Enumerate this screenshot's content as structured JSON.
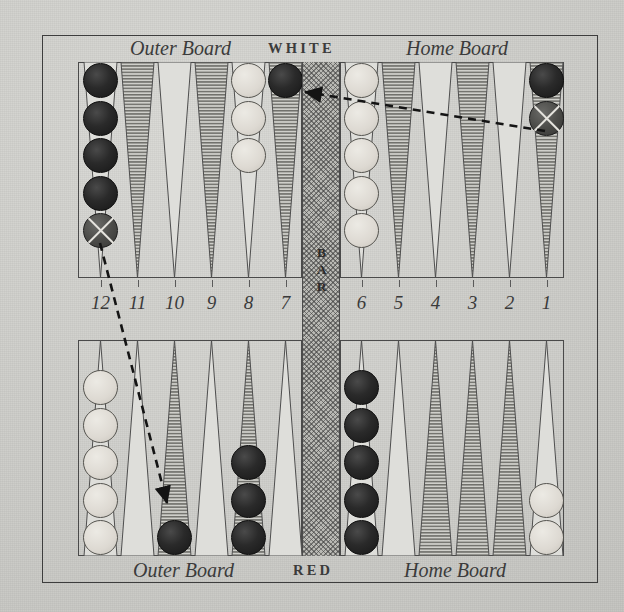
{
  "figure": {
    "kind": "backgammon-board-diagram",
    "bar_label_letters": [
      "B",
      "A",
      "R"
    ]
  },
  "captions": {
    "top_outer": "Outer Board",
    "top_player": "WHITE",
    "top_home": "Home Board",
    "bottom_outer": "Outer Board",
    "bottom_player": "RED",
    "bottom_home": "Home Board"
  },
  "point_numbers": [
    "12",
    "11",
    "10",
    "9",
    "8",
    "7",
    "6",
    "5",
    "4",
    "3",
    "2",
    "1"
  ],
  "colors": {
    "paper": "#cfcfcb",
    "ink": "#3d3d3d",
    "dark_checker": "#1c1c1c",
    "light_checker": "#ddd9d2",
    "bar_fill": "#b9b9b4",
    "hatched_point": "#9a9a95",
    "plain_point": "#d8d8d3"
  },
  "points": {
    "top": [
      {
        "number": "12",
        "shade": "plain",
        "checkers": [
          "dark",
          "dark",
          "dark",
          "dark",
          "marked"
        ]
      },
      {
        "number": "11",
        "shade": "hatched",
        "checkers": []
      },
      {
        "number": "10",
        "shade": "plain",
        "checkers": []
      },
      {
        "number": "9",
        "shade": "hatched",
        "checkers": []
      },
      {
        "number": "8",
        "shade": "plain",
        "checkers": [
          "light",
          "light",
          "light"
        ]
      },
      {
        "number": "7",
        "shade": "hatched",
        "checkers": [
          "dark"
        ]
      },
      {
        "number": "6",
        "shade": "plain",
        "checkers": [
          "light",
          "light",
          "light",
          "light",
          "light"
        ]
      },
      {
        "number": "5",
        "shade": "hatched",
        "checkers": []
      },
      {
        "number": "4",
        "shade": "plain",
        "checkers": []
      },
      {
        "number": "3",
        "shade": "hatched",
        "checkers": []
      },
      {
        "number": "2",
        "shade": "plain",
        "checkers": []
      },
      {
        "number": "1",
        "shade": "hatched",
        "checkers": [
          "dark",
          "marked"
        ]
      }
    ],
    "bottom": [
      {
        "number": "12",
        "shade": "plain",
        "checkers": [
          "light",
          "light",
          "light",
          "light",
          "light"
        ]
      },
      {
        "number": "11",
        "shade": "plain",
        "checkers": []
      },
      {
        "number": "10",
        "shade": "hatched",
        "checkers": [
          "dark"
        ]
      },
      {
        "number": "9",
        "shade": "plain",
        "checkers": []
      },
      {
        "number": "8",
        "shade": "hatched",
        "checkers": [
          "dark",
          "dark",
          "dark"
        ]
      },
      {
        "number": "7",
        "shade": "plain",
        "checkers": []
      },
      {
        "number": "6",
        "shade": "plain",
        "checkers": [
          "dark",
          "dark",
          "dark",
          "dark",
          "dark"
        ]
      },
      {
        "number": "5",
        "shade": "plain",
        "checkers": []
      },
      {
        "number": "4",
        "shade": "hatched",
        "checkers": []
      },
      {
        "number": "3",
        "shade": "hatched",
        "checkers": []
      },
      {
        "number": "2",
        "shade": "hatched",
        "checkers": []
      },
      {
        "number": "1",
        "shade": "plain",
        "checkers": [
          "light",
          "light"
        ]
      }
    ]
  },
  "move_arrows": [
    {
      "name": "arrow-top-12-to-bottom-10",
      "from": "top point 12",
      "to": "bottom point 10"
    },
    {
      "name": "arrow-top-1-to-top-7",
      "from": "top point 1",
      "to": "top point 7"
    }
  ]
}
